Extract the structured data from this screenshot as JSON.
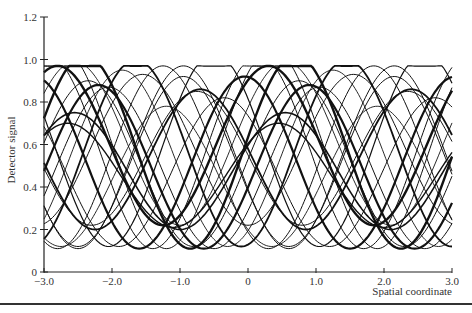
{
  "chart_data": {
    "type": "line",
    "title": "",
    "xlabel": "Spatial coordinate",
    "ylabel": "Detector signal",
    "xlim": [
      -3.0,
      3.0
    ],
    "ylim": [
      0,
      1.2
    ],
    "x_ticks": [
      -3.0,
      -2.0,
      -1.0,
      0,
      1.0,
      2.0,
      3.0
    ],
    "x_tick_labels": [
      "−3.0",
      "−2.0",
      "−1.0",
      "0",
      "1.0",
      "2.0",
      "3.0"
    ],
    "y_ticks": [
      0,
      0.2,
      0.4,
      0.6,
      0.8,
      1.0,
      1.2
    ],
    "y_tick_labels": [
      "0",
      "0.2",
      "0.4",
      "0.6",
      "0.8",
      "1.0",
      "1.2"
    ],
    "grid": false,
    "legend": null,
    "series_model": "clipped raised-cosine fringes: y = min + (max-min)*(0.5+0.5*cos(2*pi*(x-peak)/period)), saturated at 0.97",
    "period": 3.1,
    "series": [
      {
        "name": "fringe-1",
        "peak": -2.95,
        "min": 0.11,
        "max": 1.02,
        "width": 1.0
      },
      {
        "name": "fringe-2",
        "peak": -2.75,
        "min": 0.11,
        "max": 1.05,
        "width": 1.0
      },
      {
        "name": "fringe-3",
        "peak": -2.55,
        "min": 0.22,
        "max": 0.99,
        "width": 0.9
      },
      {
        "name": "fringe-4",
        "peak": -2.55,
        "min": 0.2,
        "max": 0.75,
        "width": 1.6
      },
      {
        "name": "fringe-5",
        "peak": -2.2,
        "min": 0.11,
        "max": 0.88,
        "width": 2.2
      },
      {
        "name": "fringe-6",
        "peak": -1.85,
        "min": 0.12,
        "max": 0.95,
        "width": 0.9
      },
      {
        "name": "fringe-7",
        "peak": -1.55,
        "min": 0.22,
        "max": 0.93,
        "width": 1.0
      },
      {
        "name": "fringe-8",
        "peak": -1.2,
        "min": 0.12,
        "max": 0.78,
        "width": 0.9
      },
      {
        "name": "fringe-9",
        "peak": -0.95,
        "min": 0.11,
        "max": 0.97,
        "width": 1.0
      },
      {
        "name": "fringe-10",
        "peak": -0.7,
        "min": 0.2,
        "max": 0.86,
        "width": 1.8
      },
      {
        "name": "fringe-11",
        "peak": -0.35,
        "min": 0.12,
        "max": 0.82,
        "width": 1.0
      },
      {
        "name": "fringe-12",
        "peak": -0.05,
        "min": 0.11,
        "max": 0.92,
        "width": 2.2
      },
      {
        "name": "fringe-13",
        "peak": 0.3,
        "min": 0.22,
        "max": 0.97,
        "width": 2.4
      },
      {
        "name": "fringe-14",
        "peak": 0.45,
        "min": 0.21,
        "max": 0.7,
        "width": 1.4
      },
      {
        "name": "fringe-15",
        "peak": 0.75,
        "min": 0.12,
        "max": 0.9,
        "width": 1.0
      },
      {
        "name": "fringe-16",
        "peak": 1.05,
        "min": 0.11,
        "max": 0.87,
        "width": 1.0
      },
      {
        "name": "fringe-17",
        "peak": 1.45,
        "min": 0.12,
        "max": 1.0,
        "width": 1.8
      },
      {
        "name": "fringe-18",
        "peak": 1.85,
        "min": 0.11,
        "max": 0.97,
        "width": 1.0
      },
      {
        "name": "fringe-19",
        "peak": 2.15,
        "min": 0.12,
        "max": 0.92,
        "width": 1.0
      },
      {
        "name": "fringe-20",
        "peak": 2.35,
        "min": 0.22,
        "max": 0.85,
        "width": 1.0
      },
      {
        "name": "fringe-21",
        "peak": 2.6,
        "min": 0.12,
        "max": 1.03,
        "width": 1.2
      },
      {
        "name": "fringe-22",
        "peak": 3.8,
        "min": 0.11,
        "max": 1.02,
        "width": 2.4
      }
    ],
    "saturation_level": 0.97
  },
  "layout": {
    "plot_left": 44,
    "plot_right": 452,
    "plot_top": 17,
    "plot_bottom": 272,
    "line_color": "#111111",
    "axis_color": "#222222"
  }
}
